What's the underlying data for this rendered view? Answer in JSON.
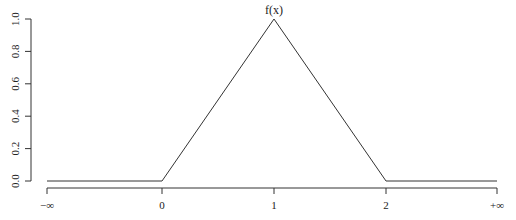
{
  "chart_data": {
    "type": "line",
    "title": "f(x)",
    "xlabel": "",
    "ylabel": "",
    "x_ticks": [
      "−∞",
      "0",
      "1",
      "2",
      "+∞"
    ],
    "y_ticks": [
      "0.0",
      "0.2",
      "0.4",
      "0.6",
      "0.8",
      "1.0"
    ],
    "ylim": [
      0,
      1
    ],
    "grid": false,
    "legend": null,
    "series": [
      {
        "name": "f(x)",
        "points": [
          {
            "x": "−∞",
            "y": 0
          },
          {
            "x": 0,
            "y": 0
          },
          {
            "x": 1,
            "y": 1
          },
          {
            "x": 2,
            "y": 0
          },
          {
            "x": "+∞",
            "y": 0
          }
        ]
      }
    ]
  },
  "layout": {
    "y_axis_x": 31,
    "y_top_px": 19,
    "y_bottom_px": 181,
    "x_axis_y": 188,
    "x_tick_px": [
      47,
      162,
      274,
      386,
      497
    ]
  }
}
